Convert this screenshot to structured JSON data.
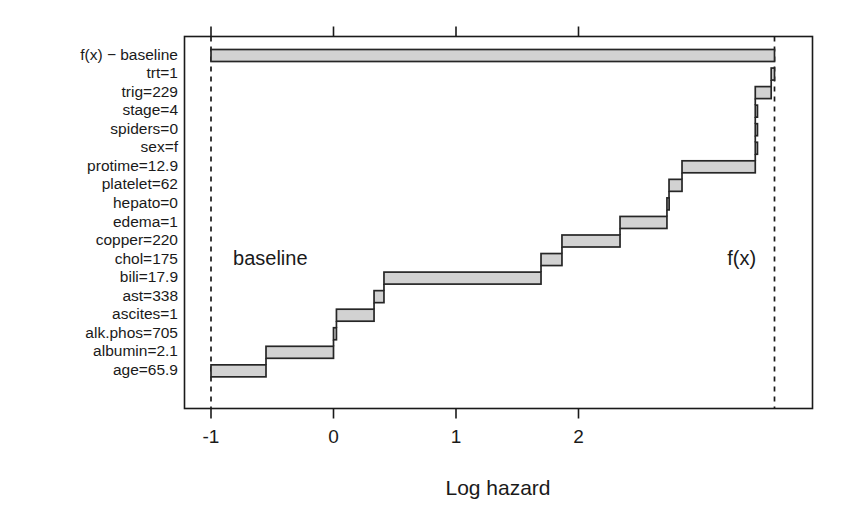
{
  "chart_data": {
    "type": "bar",
    "subtype": "waterfall-step",
    "title": "",
    "xlabel": "Log hazard",
    "ylabel": "",
    "xlim": [
      -1.22,
      3.69
    ],
    "ylim_rows": 18,
    "grid": false,
    "legend": "none",
    "xticks": [
      -1,
      0,
      1,
      2
    ],
    "xtick_labels": [
      "-1",
      "0",
      "1",
      "2"
    ],
    "baseline_value": -1.0,
    "fx_value": 3.6,
    "annotations": [
      {
        "text": "baseline",
        "x": -0.82,
        "row": 11,
        "align": "left"
      },
      {
        "text": "f(x)",
        "x": 3.45,
        "row": 11,
        "align": "right"
      }
    ],
    "reference_lines": [
      {
        "label": "baseline",
        "x": -1.0,
        "style": "dashed"
      },
      {
        "label": "f(x)",
        "x": 3.6,
        "style": "dashed"
      }
    ],
    "rows": [
      {
        "label": "f(x) − baseline",
        "start": -1.0,
        "end": 3.6,
        "contribution": 4.6,
        "total_bar": true
      },
      {
        "label": "trt=1",
        "start": 3.573,
        "end": 3.6,
        "contribution": 0.027
      },
      {
        "label": "trig=229",
        "start": 3.443,
        "end": 3.573,
        "contribution": 0.13
      },
      {
        "label": "stage=4",
        "start": 3.443,
        "end": 3.443,
        "contribution": 0.0
      },
      {
        "label": "spiders=0",
        "start": 3.443,
        "end": 3.443,
        "contribution": 0.0
      },
      {
        "label": "sex=f",
        "start": 3.443,
        "end": 3.443,
        "contribution": 0.0
      },
      {
        "label": "protime=12.9",
        "start": 2.845,
        "end": 3.443,
        "contribution": 0.598
      },
      {
        "label": "platelet=62",
        "start": 2.739,
        "end": 2.845,
        "contribution": 0.106
      },
      {
        "label": "hepato=0",
        "start": 2.722,
        "end": 2.739,
        "contribution": 0.017
      },
      {
        "label": "edema=1",
        "start": 2.339,
        "end": 2.722,
        "contribution": 0.383
      },
      {
        "label": "copper=220",
        "start": 1.865,
        "end": 2.339,
        "contribution": 0.474
      },
      {
        "label": "chol=175",
        "start": 1.694,
        "end": 1.865,
        "contribution": 0.171
      },
      {
        "label": "bili=17.9",
        "start": 0.412,
        "end": 1.694,
        "contribution": 1.282
      },
      {
        "label": "ast=338",
        "start": 0.331,
        "end": 0.412,
        "contribution": 0.081
      },
      {
        "label": "ascites=1",
        "start": 0.024,
        "end": 0.331,
        "contribution": 0.307
      },
      {
        "label": "alk.phos=705",
        "start": 0.0,
        "end": 0.024,
        "contribution": 0.024
      },
      {
        "label": "albumin=2.1",
        "start": -0.551,
        "end": 0.0,
        "contribution": 0.551
      },
      {
        "label": "age=65.9",
        "start": -1.0,
        "end": -0.551,
        "contribution": 0.449
      }
    ]
  },
  "colors": {
    "bar_fill": "#d2d2d2",
    "bar_stroke": "#262626",
    "axis": "#1a1a1a",
    "background": "#ffffff"
  }
}
